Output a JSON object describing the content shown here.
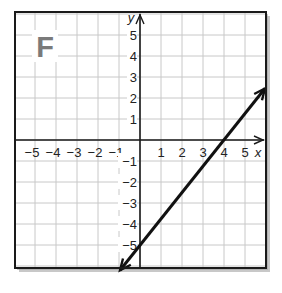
{
  "panel_label": "F",
  "chart_data": {
    "type": "line",
    "title": "",
    "panel_label": "F",
    "xlabel": "x",
    "ylabel": "y",
    "xlim": [
      -6,
      6
    ],
    "ylim": [
      -6,
      6
    ],
    "grid": true,
    "x_ticks": [
      -5,
      -4,
      -3,
      -2,
      -1,
      1,
      2,
      3,
      4,
      5
    ],
    "y_ticks": [
      -5,
      -4,
      -3,
      -2,
      -1,
      1,
      2,
      3,
      4,
      5
    ],
    "x_tick_labels": [
      "−5",
      "−4",
      "−3",
      "−2",
      "−1",
      "1",
      "2",
      "3",
      "4",
      "5"
    ],
    "y_tick_labels": [
      "−5",
      "−4",
      "−3",
      "−2",
      "−1",
      "1",
      "2",
      "3",
      "4",
      "5"
    ],
    "series": [
      {
        "name": "line",
        "equation": "y = 1.25x - 5",
        "slope": 1.25,
        "y_intercept": -5,
        "x_intercept": 4,
        "arrows_both_ends": true,
        "x": [
          -0.95,
          0,
          4,
          5.95
        ],
        "y": [
          -6.2,
          -5,
          0,
          2.45
        ]
      }
    ]
  },
  "colors": {
    "grid": "#c8c8c8",
    "axis": "#1a1a1a",
    "frame": "#1a1a1a",
    "line": "#111111",
    "label_gray": "#7a7a7a",
    "shadow": "#9a9a9a"
  }
}
